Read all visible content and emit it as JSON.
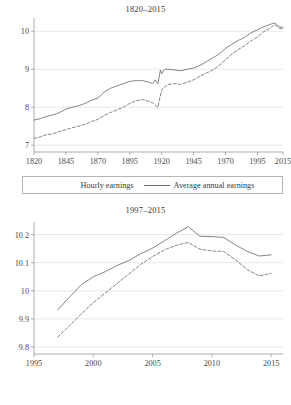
{
  "figure": {
    "panels": [
      "top",
      "bottom"
    ]
  },
  "legend": {
    "hourly_label": "Hourly earnings",
    "annual_label": "Average annual earnings",
    "hourly_style": "dashed",
    "annual_style": "solid"
  },
  "colors": {
    "line": "#6f6f6f",
    "grid": "#d9d9d9",
    "axis": "#9a9a9a",
    "text": "#3a3a3a",
    "background": "#ffffff"
  },
  "chart_data": [
    {
      "type": "line",
      "title": "1820–2015",
      "xlabel": "",
      "ylabel": "",
      "xlim": [
        1820,
        2015
      ],
      "ylim": [
        6.82,
        10.35
      ],
      "xticks": [
        1820,
        1845,
        1870,
        1895,
        1920,
        1945,
        1970,
        1995,
        2015
      ],
      "yticks": [
        7,
        8,
        9,
        10
      ],
      "grid": "horizontal",
      "legend_position": "below",
      "series": [
        {
          "name": "Hourly earnings",
          "style": "dashed",
          "x": [
            1820,
            1825,
            1830,
            1835,
            1840,
            1845,
            1850,
            1855,
            1860,
            1865,
            1870,
            1875,
            1880,
            1885,
            1890,
            1895,
            1900,
            1905,
            1910,
            1913,
            1915,
            1917,
            1919,
            1920,
            1921,
            1923,
            1925,
            1930,
            1935,
            1940,
            1945,
            1950,
            1955,
            1960,
            1965,
            1970,
            1975,
            1980,
            1985,
            1990,
            1995,
            2000,
            2005,
            2008,
            2010,
            2012,
            2015
          ],
          "values": [
            7.18,
            7.22,
            7.28,
            7.3,
            7.36,
            7.41,
            7.46,
            7.5,
            7.55,
            7.62,
            7.68,
            7.78,
            7.86,
            7.93,
            8.0,
            8.1,
            8.17,
            8.2,
            8.15,
            8.12,
            8.05,
            8.0,
            8.32,
            8.45,
            8.5,
            8.55,
            8.6,
            8.62,
            8.6,
            8.66,
            8.72,
            8.82,
            8.9,
            8.98,
            9.1,
            9.25,
            9.4,
            9.52,
            9.62,
            9.75,
            9.85,
            9.99,
            10.08,
            10.17,
            10.14,
            10.08,
            10.06
          ]
        },
        {
          "name": "Average annual earnings",
          "style": "solid",
          "x": [
            1820,
            1825,
            1830,
            1835,
            1840,
            1845,
            1850,
            1855,
            1860,
            1865,
            1870,
            1875,
            1880,
            1885,
            1890,
            1895,
            1900,
            1905,
            1910,
            1913,
            1915,
            1917,
            1919,
            1920,
            1921,
            1923,
            1925,
            1930,
            1935,
            1940,
            1945,
            1950,
            1955,
            1960,
            1965,
            1970,
            1975,
            1980,
            1985,
            1990,
            1995,
            2000,
            2005,
            2008,
            2010,
            2012,
            2015
          ],
          "values": [
            7.66,
            7.7,
            7.76,
            7.8,
            7.86,
            7.95,
            8.0,
            8.04,
            8.1,
            8.18,
            8.24,
            8.4,
            8.5,
            8.56,
            8.62,
            8.68,
            8.7,
            8.7,
            8.66,
            8.62,
            8.72,
            8.62,
            8.98,
            8.88,
            8.95,
            9.0,
            9.0,
            8.98,
            8.96,
            9.0,
            9.03,
            9.1,
            9.2,
            9.3,
            9.4,
            9.55,
            9.66,
            9.76,
            9.84,
            9.96,
            10.04,
            10.12,
            10.18,
            10.22,
            10.18,
            10.12,
            10.1
          ]
        }
      ]
    },
    {
      "type": "line",
      "title": "1997–2015",
      "xlabel": "",
      "ylabel": "",
      "xlim": [
        1995,
        2016
      ],
      "ylim": [
        9.775,
        10.245
      ],
      "xticks": [
        1995,
        2000,
        2005,
        2010,
        2015
      ],
      "yticks": [
        9.8,
        9.9,
        10,
        10.1,
        10.2
      ],
      "ytick_labels": [
        "9.8",
        "9.9",
        "10",
        "10.1",
        "10.2"
      ],
      "grid": "horizontal",
      "legend_position": "below",
      "series": [
        {
          "name": "Hourly earnings",
          "style": "dashed",
          "x": [
            1997,
            1998,
            1999,
            2000,
            2001,
            2002,
            2003,
            2004,
            2005,
            2006,
            2007,
            2008,
            2009,
            2010,
            2011,
            2012,
            2013,
            2014,
            2015
          ],
          "values": [
            9.835,
            9.876,
            9.918,
            9.958,
            9.992,
            10.026,
            10.06,
            10.094,
            10.122,
            10.146,
            10.162,
            10.172,
            10.148,
            10.142,
            10.14,
            10.11,
            10.075,
            10.053,
            10.062
          ]
        },
        {
          "name": "Average annual earnings",
          "style": "solid",
          "x": [
            1997,
            1998,
            1999,
            2000,
            2001,
            2002,
            2003,
            2004,
            2005,
            2006,
            2007,
            2008,
            2009,
            2010,
            2011,
            2012,
            2013,
            2014,
            2015
          ],
          "values": [
            9.932,
            9.978,
            10.022,
            10.05,
            10.068,
            10.09,
            10.108,
            10.132,
            10.152,
            10.178,
            10.205,
            10.228,
            10.194,
            10.193,
            10.19,
            10.163,
            10.14,
            10.124,
            10.128
          ]
        }
      ]
    }
  ]
}
